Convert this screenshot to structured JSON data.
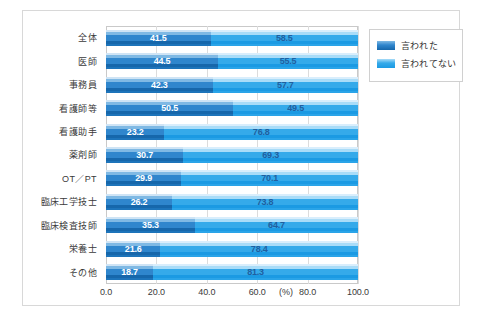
{
  "chart_data": {
    "type": "bar",
    "subtype": "stacked-horizontal-100",
    "title": "",
    "xlabel": "(%)",
    "ylabel": "",
    "xlim": [
      0,
      100
    ],
    "xticks": [
      "0.0",
      "20.0",
      "40.0",
      "60.0",
      "80.0",
      "100.0"
    ],
    "xtick_values": [
      0,
      20,
      40,
      60,
      80,
      100
    ],
    "grid": true,
    "legend_position": "right-top",
    "categories": [
      "全体",
      "医師",
      "事務員",
      "看護師等",
      "看護助手",
      "薬剤師",
      "OT／PT",
      "臨床工学技士",
      "臨床検査技師",
      "栄養士",
      "その他"
    ],
    "series": [
      {
        "name": "言われた",
        "color": "#2f86cd",
        "values": [
          41.5,
          44.5,
          42.3,
          50.5,
          23.2,
          30.7,
          29.9,
          26.2,
          35.3,
          21.6,
          18.7
        ],
        "labels": [
          "41.5",
          "44.5",
          "42.3",
          "50.5",
          "23.2",
          "30.7",
          "29.9",
          "26.2",
          "35.3",
          "21.6",
          "18.7"
        ]
      },
      {
        "name": "言われてない",
        "color": "#35aaea",
        "values": [
          58.5,
          55.5,
          57.7,
          49.5,
          76.8,
          69.3,
          70.1,
          73.8,
          64.7,
          78.4,
          81.3
        ],
        "labels": [
          "58.5",
          "55.5",
          "57.7",
          "49.5",
          "76.8",
          "69.3",
          "70.1",
          "73.8",
          "64.7",
          "78.4",
          "81.3"
        ]
      }
    ]
  },
  "legend": {
    "items": [
      {
        "label": "言われた"
      },
      {
        "label": "言われてない"
      }
    ]
  },
  "axis": {
    "unit": "(%)"
  }
}
